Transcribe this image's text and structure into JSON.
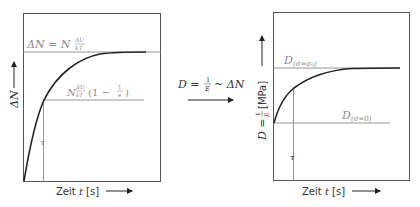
{
  "left_panel": {
    "y_axis_label": "ΔN",
    "x_axis_label_prefix": "Zeit ",
    "x_axis_var": "t",
    "x_axis_unit": " [s]",
    "asymptote_label": "ΔN = N ΔU/kT",
    "asymptote_label_parts": {
      "lhs": "ΔN = N",
      "frac_num": "ΔU",
      "frac_den": "kT"
    },
    "tau_level_label": "N ΔU/kT (1 − 1/e)",
    "tau_level_parts": {
      "N": "N",
      "frac_num": "ΔU",
      "frac_den": "kT",
      "paren": "(1 − ",
      "e_num": "1",
      "e_den": "e",
      "close": ")"
    },
    "tau_label": "τ"
  },
  "center": {
    "relation_label": "D = 1/E ~ ΔN",
    "relation_parts": {
      "lhs": "D =",
      "num": "1",
      "den": "E",
      "rhs": "~ ΔN"
    }
  },
  "right_panel": {
    "y_axis_label_prefix": "D = ",
    "y_axis_frac_num": "1",
    "y_axis_frac_den": "E",
    "y_axis_unit": " [MPa]",
    "x_axis_label_prefix": "Zeit ",
    "x_axis_var": "t",
    "x_axis_unit": " [s]",
    "upper_label": "D(σ=σ0)",
    "upper_label_parts": {
      "D": "D",
      "sub": "(σ=σ₀)"
    },
    "lower_label": "D(σ=0)",
    "lower_label_parts": {
      "D": "D",
      "sub": "(σ=0)"
    },
    "tau_label": "τ"
  },
  "colors": {
    "frame": "#555555",
    "curve": "#222222",
    "guide": "#888888",
    "label_gray": "#8a8a8a"
  }
}
